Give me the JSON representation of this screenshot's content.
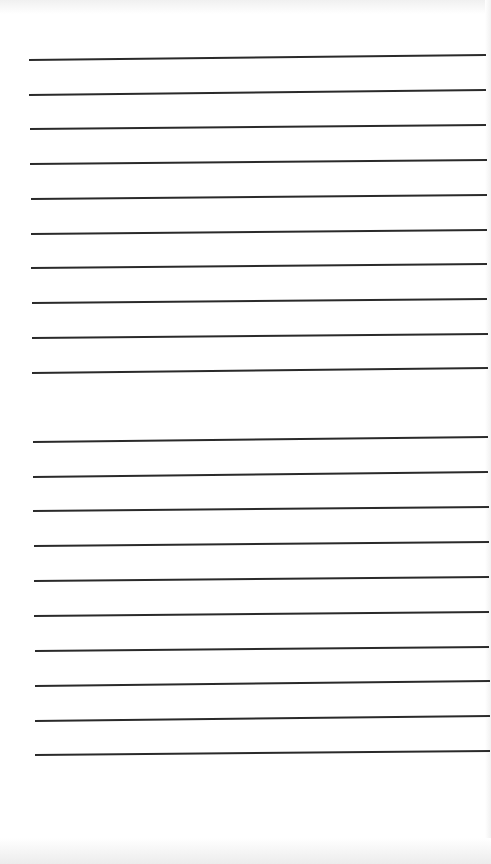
{
  "page": {
    "type": "lined-paper",
    "background_color": "#ffffff",
    "line_color": "#2a2a2a",
    "text": ""
  },
  "lines": {
    "group_1": [
      {
        "y1": 59,
        "y2": 54,
        "x1": 29,
        "x2": 486
      },
      {
        "y1": 94,
        "y2": 89,
        "x1": 29,
        "x2": 486
      },
      {
        "y1": 128,
        "y2": 124,
        "x1": 30,
        "x2": 486
      },
      {
        "y1": 163,
        "y2": 159,
        "x1": 30,
        "x2": 487
      },
      {
        "y1": 198,
        "y2": 194,
        "x1": 31,
        "x2": 487
      },
      {
        "y1": 233,
        "y2": 229,
        "x1": 31,
        "x2": 487
      },
      {
        "y1": 267,
        "y2": 263,
        "x1": 31,
        "x2": 487
      },
      {
        "y1": 302,
        "y2": 298,
        "x1": 32,
        "x2": 487
      },
      {
        "y1": 337,
        "y2": 333,
        "x1": 32,
        "x2": 488
      },
      {
        "y1": 372,
        "y2": 367,
        "x1": 32,
        "x2": 488
      }
    ],
    "group_2": [
      {
        "y1": 441,
        "y2": 436,
        "x1": 33,
        "x2": 488
      },
      {
        "y1": 476,
        "y2": 471,
        "x1": 33,
        "x2": 488
      },
      {
        "y1": 510,
        "y2": 506,
        "x1": 33,
        "x2": 489
      },
      {
        "y1": 545,
        "y2": 541,
        "x1": 34,
        "x2": 489
      },
      {
        "y1": 580,
        "y2": 576,
        "x1": 34,
        "x2": 489
      },
      {
        "y1": 615,
        "y2": 611,
        "x1": 34,
        "x2": 489
      },
      {
        "y1": 650,
        "y2": 646,
        "x1": 35,
        "x2": 489
      },
      {
        "y1": 685,
        "y2": 680,
        "x1": 35,
        "x2": 490
      },
      {
        "y1": 720,
        "y2": 715,
        "x1": 35,
        "x2": 490
      },
      {
        "y1": 754,
        "y2": 750,
        "x1": 35,
        "x2": 490
      }
    ]
  }
}
